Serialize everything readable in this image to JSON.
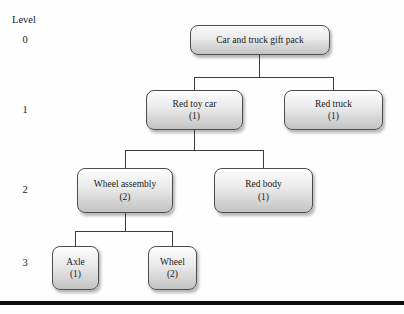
{
  "diagram": {
    "type": "tree",
    "axis_title": "Level",
    "level_labels": [
      "0",
      "1",
      "2",
      "3"
    ],
    "nodes": {
      "root": {
        "name": "Car and truck gift pack",
        "level": 0
      },
      "red_toy_car": {
        "name": "Red toy car",
        "qty": "(1)",
        "level": 1
      },
      "red_truck": {
        "name": "Red truck",
        "qty": "(1)",
        "level": 1
      },
      "wheel_assembly": {
        "name": "Wheel assembly",
        "qty": "(2)",
        "level": 2
      },
      "red_body": {
        "name": "Red body",
        "qty": "(1)",
        "level": 2
      },
      "axle": {
        "name": "Axle",
        "qty": "(1)",
        "level": 3
      },
      "wheel": {
        "name": "Wheel",
        "qty": "(2)",
        "level": 3
      }
    },
    "edges": [
      [
        "root",
        "red_toy_car"
      ],
      [
        "root",
        "red_truck"
      ],
      [
        "red_toy_car",
        "wheel_assembly"
      ],
      [
        "red_toy_car",
        "red_body"
      ],
      [
        "wheel_assembly",
        "axle"
      ],
      [
        "wheel_assembly",
        "wheel"
      ]
    ],
    "colors": {
      "node_fill_top": "#fdfdfd",
      "node_fill_bottom": "#c3c3c3",
      "node_border": "#4d4d4d",
      "connector_line": "#3c3c3c",
      "text": "#1a1a1a",
      "bottom_rule": "#101010"
    }
  }
}
